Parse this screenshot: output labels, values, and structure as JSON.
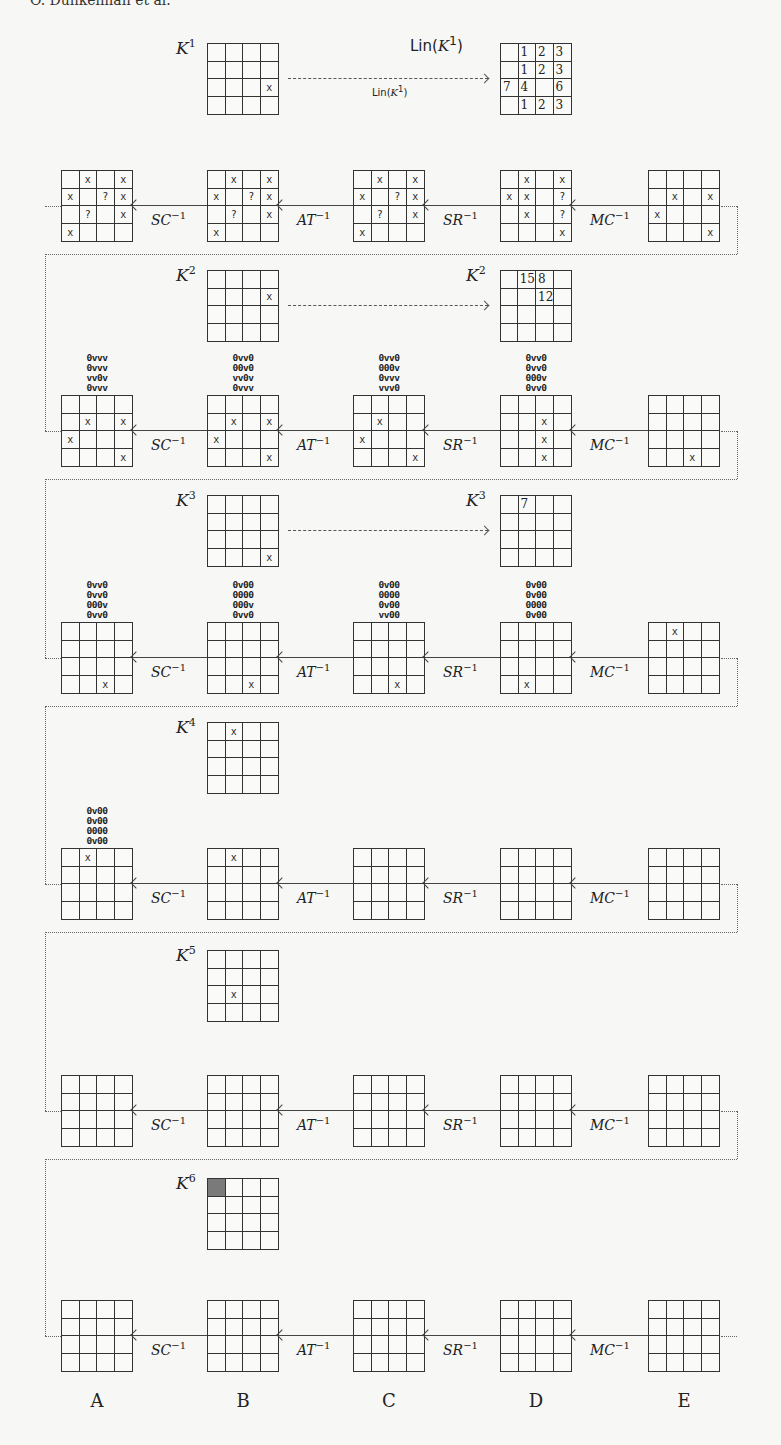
{
  "header": {
    "text": "O. Dunkelman et al."
  },
  "columns": [
    "A",
    "B",
    "C",
    "D",
    "E"
  ],
  "ops": [
    "SC",
    "AT",
    "SR",
    "MC"
  ],
  "op_exponent": "−1",
  "lin_label": "Lin(",
  "lin_arg": "K",
  "lin_close": ")",
  "key_letter": "K",
  "key_rounds": [
    {
      "sup": "1",
      "grid": [
        [
          "",
          "",
          "",
          ""
        ],
        [
          "",
          "",
          "",
          ""
        ],
        [
          "",
          "",
          "",
          "x"
        ],
        [
          "",
          "",
          "",
          ""
        ]
      ],
      "target_label_sup": "1",
      "target_is_lin": true,
      "target": [
        [
          "",
          "1",
          "2",
          "3"
        ],
        [
          "",
          "1",
          "2",
          "3"
        ],
        [
          "7",
          "4",
          "",
          "6"
        ],
        [
          "",
          "1",
          "2",
          "3"
        ]
      ]
    },
    {
      "sup": "2",
      "grid": [
        [
          "",
          "",
          "",
          ""
        ],
        [
          "",
          "",
          "",
          "x"
        ],
        [
          "",
          "",
          "",
          ""
        ],
        [
          "",
          "",
          "",
          ""
        ]
      ],
      "target_label_sup": "2",
      "target_is_lin": false,
      "target": [
        [
          "",
          "15",
          "8",
          ""
        ],
        [
          "",
          "",
          "12",
          ""
        ],
        [
          "",
          "",
          "",
          ""
        ],
        [
          "",
          "",
          "",
          ""
        ]
      ]
    },
    {
      "sup": "3",
      "grid": [
        [
          "",
          "",
          "",
          ""
        ],
        [
          "",
          "",
          "",
          ""
        ],
        [
          "",
          "",
          "",
          ""
        ],
        [
          "",
          "",
          "",
          "x"
        ]
      ],
      "target_label_sup": "3",
      "target_is_lin": false,
      "target": [
        [
          "",
          "7",
          "",
          ""
        ],
        [
          "",
          "",
          "",
          ""
        ],
        [
          "",
          "",
          "",
          ""
        ],
        [
          "",
          "",
          "",
          ""
        ]
      ]
    },
    {
      "sup": "4",
      "grid": [
        [
          "",
          "x",
          "",
          ""
        ],
        [
          "",
          "",
          "",
          ""
        ],
        [
          "",
          "",
          "",
          ""
        ],
        [
          "",
          "",
          "",
          ""
        ]
      ]
    },
    {
      "sup": "5",
      "grid": [
        [
          "",
          "",
          "",
          ""
        ],
        [
          "",
          "",
          "",
          ""
        ],
        [
          "",
          "x",
          "",
          ""
        ],
        [
          "",
          "",
          "",
          ""
        ]
      ]
    },
    {
      "sup": "6",
      "grid": [
        [
          "F",
          "",
          "",
          ""
        ],
        [
          "",
          "",
          "",
          ""
        ],
        [
          "",
          "",
          "",
          ""
        ],
        [
          "",
          "",
          "",
          ""
        ]
      ]
    }
  ],
  "rows": [
    {
      "patterns": [
        null,
        null,
        null,
        null,
        null
      ],
      "grids": [
        [
          [
            "",
            "x",
            "",
            "x"
          ],
          [
            "x",
            "",
            "?",
            "x"
          ],
          [
            "",
            "?",
            "",
            "x"
          ],
          [
            "x",
            "",
            "",
            ""
          ]
        ],
        [
          [
            "",
            "x",
            "",
            "x"
          ],
          [
            "x",
            "",
            "?",
            "x"
          ],
          [
            "",
            "?",
            "",
            "x"
          ],
          [
            "x",
            "",
            "",
            ""
          ]
        ],
        [
          [
            "",
            "x",
            "",
            "x"
          ],
          [
            "x",
            "",
            "?",
            "x"
          ],
          [
            "",
            "?",
            "",
            "x"
          ],
          [
            "x",
            "",
            "",
            ""
          ]
        ],
        [
          [
            "",
            "x",
            "",
            "x"
          ],
          [
            "x",
            "x",
            "",
            "?"
          ],
          [
            "",
            "x",
            "",
            "?"
          ],
          [
            "",
            "",
            "",
            "x"
          ]
        ],
        [
          [
            "",
            "",
            "",
            ""
          ],
          [
            "",
            "x",
            "",
            "x"
          ],
          [
            "x",
            "",
            "",
            ""
          ],
          [
            "",
            "",
            "",
            "x"
          ]
        ]
      ]
    },
    {
      "patterns": [
        [
          "0vvv",
          "0vvv",
          "vv0v",
          "0vvv"
        ],
        [
          "0vv0",
          "00v0",
          "vv0v",
          "0vvv"
        ],
        [
          "0vv0",
          "000v",
          "0vvv",
          "vvv0"
        ],
        [
          "0vv0",
          "0vv0",
          "000v",
          "0vv0"
        ],
        null
      ],
      "grids": [
        [
          [
            "",
            "",
            "",
            ""
          ],
          [
            "",
            "x",
            "",
            "x"
          ],
          [
            "x",
            "",
            "",
            ""
          ],
          [
            "",
            "",
            "",
            "x"
          ]
        ],
        [
          [
            "",
            "",
            "",
            ""
          ],
          [
            "",
            "x",
            "",
            "x"
          ],
          [
            "x",
            "",
            "",
            ""
          ],
          [
            "",
            "",
            "",
            "x"
          ]
        ],
        [
          [
            "",
            "",
            "",
            ""
          ],
          [
            "",
            "x",
            "",
            ""
          ],
          [
            "x",
            "",
            "",
            ""
          ],
          [
            "",
            "",
            "",
            "x"
          ]
        ],
        [
          [
            "",
            "",
            "",
            ""
          ],
          [
            "",
            "",
            "x",
            ""
          ],
          [
            "",
            "",
            "x",
            ""
          ],
          [
            "",
            "",
            "x",
            ""
          ]
        ],
        [
          [
            "",
            "",
            "",
            ""
          ],
          [
            "",
            "",
            "",
            ""
          ],
          [
            "",
            "",
            "",
            ""
          ],
          [
            "",
            "",
            "x",
            ""
          ]
        ]
      ]
    },
    {
      "patterns": [
        [
          "0vv0",
          "0vv0",
          "000v",
          "0vv0"
        ],
        [
          "0v00",
          "0000",
          "000v",
          "0vv0"
        ],
        [
          "0v00",
          "0000",
          "0v00",
          "vv00"
        ],
        [
          "0v00",
          "0v00",
          "0000",
          "0v00"
        ],
        null
      ],
      "grids": [
        [
          [
            "",
            "",
            "",
            ""
          ],
          [
            "",
            "",
            "",
            ""
          ],
          [
            "",
            "",
            "",
            ""
          ],
          [
            "",
            "",
            "x",
            ""
          ]
        ],
        [
          [
            "",
            "",
            "",
            ""
          ],
          [
            "",
            "",
            "",
            ""
          ],
          [
            "",
            "",
            "",
            ""
          ],
          [
            "",
            "",
            "x",
            ""
          ]
        ],
        [
          [
            "",
            "",
            "",
            ""
          ],
          [
            "",
            "",
            "",
            ""
          ],
          [
            "",
            "",
            "",
            ""
          ],
          [
            "",
            "",
            "x",
            ""
          ]
        ],
        [
          [
            "",
            "",
            "",
            ""
          ],
          [
            "",
            "",
            "",
            ""
          ],
          [
            "",
            "",
            "",
            ""
          ],
          [
            "",
            "x",
            "",
            ""
          ]
        ],
        [
          [
            "",
            "x",
            "",
            ""
          ],
          [
            "",
            "",
            "",
            ""
          ],
          [
            "",
            "",
            "",
            ""
          ],
          [
            "",
            "",
            "",
            ""
          ]
        ]
      ]
    },
    {
      "patterns": [
        [
          "0v00",
          "0v00",
          "0000",
          "0v00"
        ],
        null,
        null,
        null,
        null
      ],
      "grids": [
        [
          [
            "",
            "x",
            "",
            ""
          ],
          [
            "",
            "",
            "",
            ""
          ],
          [
            "",
            "",
            "",
            ""
          ],
          [
            "",
            "",
            "",
            ""
          ]
        ],
        [
          [
            "",
            "x",
            "",
            ""
          ],
          [
            "",
            "",
            "",
            ""
          ],
          [
            "",
            "",
            "",
            ""
          ],
          [
            "",
            "",
            "",
            ""
          ]
        ],
        [
          [
            "",
            "",
            "",
            ""
          ],
          [
            "",
            "",
            "",
            ""
          ],
          [
            "",
            "",
            "",
            ""
          ],
          [
            "",
            "",
            "",
            ""
          ]
        ],
        [
          [
            "",
            "",
            "",
            ""
          ],
          [
            "",
            "",
            "",
            ""
          ],
          [
            "",
            "",
            "",
            ""
          ],
          [
            "",
            "",
            "",
            ""
          ]
        ],
        [
          [
            "",
            "",
            "",
            ""
          ],
          [
            "",
            "",
            "",
            ""
          ],
          [
            "",
            "",
            "",
            ""
          ],
          [
            "",
            "",
            "",
            ""
          ]
        ]
      ]
    },
    {
      "patterns": [
        null,
        null,
        null,
        null,
        null
      ],
      "grids": [
        [
          [
            "",
            "",
            "",
            ""
          ],
          [
            "",
            "",
            "",
            ""
          ],
          [
            "",
            "",
            "",
            ""
          ],
          [
            "",
            "",
            "",
            ""
          ]
        ],
        [
          [
            "",
            "",
            "",
            ""
          ],
          [
            "",
            "",
            "",
            ""
          ],
          [
            "",
            "",
            "",
            ""
          ],
          [
            "",
            "",
            "",
            ""
          ]
        ],
        [
          [
            "",
            "",
            "",
            ""
          ],
          [
            "",
            "",
            "",
            ""
          ],
          [
            "",
            "",
            "",
            ""
          ],
          [
            "",
            "",
            "",
            ""
          ]
        ],
        [
          [
            "",
            "",
            "",
            ""
          ],
          [
            "",
            "",
            "",
            ""
          ],
          [
            "",
            "",
            "",
            ""
          ],
          [
            "",
            "",
            "",
            ""
          ]
        ],
        [
          [
            "",
            "",
            "",
            ""
          ],
          [
            "",
            "",
            "",
            ""
          ],
          [
            "",
            "",
            "",
            ""
          ],
          [
            "",
            "",
            "",
            ""
          ]
        ]
      ]
    },
    {
      "patterns": [
        null,
        null,
        null,
        null,
        null
      ],
      "grids": [
        [
          [
            "",
            "",
            "",
            ""
          ],
          [
            "",
            "",
            "",
            ""
          ],
          [
            "",
            "",
            "",
            ""
          ],
          [
            "",
            "",
            "",
            ""
          ]
        ],
        [
          [
            "",
            "",
            "",
            ""
          ],
          [
            "",
            "",
            "",
            ""
          ],
          [
            "",
            "",
            "",
            ""
          ],
          [
            "",
            "",
            "",
            ""
          ]
        ],
        [
          [
            "",
            "",
            "",
            ""
          ],
          [
            "",
            "",
            "",
            ""
          ],
          [
            "",
            "",
            "",
            ""
          ],
          [
            "",
            "",
            "",
            ""
          ]
        ],
        [
          [
            "",
            "",
            "",
            ""
          ],
          [
            "",
            "",
            "",
            ""
          ],
          [
            "",
            "",
            "",
            ""
          ],
          [
            "",
            "",
            "",
            ""
          ]
        ],
        [
          [
            "",
            "",
            "",
            ""
          ],
          [
            "",
            "",
            "",
            ""
          ],
          [
            "",
            "",
            "",
            ""
          ],
          [
            "",
            "",
            "",
            ""
          ]
        ]
      ]
    }
  ]
}
